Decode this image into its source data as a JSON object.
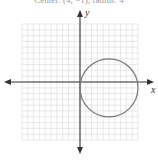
{
  "caption": "Center: (4, −1); radius: 4",
  "axes": {
    "x_label": "x",
    "y_label": "y"
  },
  "graph": {
    "grid_range": {
      "x": [
        -10,
        10
      ],
      "y": [
        -10,
        10
      ]
    },
    "circle": {
      "center": [
        5,
        -1
      ],
      "radius": 5,
      "color": "#777777"
    },
    "grid_color": "#d6d6d6",
    "axis_color": "#333333"
  }
}
